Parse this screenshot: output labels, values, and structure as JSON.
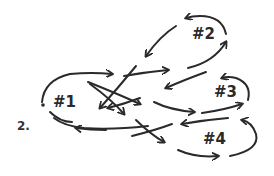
{
  "figure": {
    "label": "2.",
    "style": "hand-drawn",
    "stroke_color": "#2a2a2a",
    "background": "#ffffff"
  },
  "nodes": [
    {
      "id": "n1",
      "label": "#1"
    },
    {
      "id": "n2",
      "label": "#2"
    },
    {
      "id": "n3",
      "label": "#3"
    },
    {
      "id": "n4",
      "label": "#4"
    }
  ],
  "edges": [
    {
      "from": "#1",
      "to": "#3",
      "shape": "curved, over top"
    },
    {
      "from": "#1",
      "to": "#3",
      "shape": "crossing diagonal"
    },
    {
      "from": "#1",
      "to": "#4",
      "shape": "crossing diagonal"
    },
    {
      "from": "#3",
      "to": "#1",
      "shape": "crossing diagonal"
    },
    {
      "from": "#2",
      "to": "#1",
      "shape": "crossing diagonal"
    },
    {
      "from": "#4",
      "to": "#1",
      "shape": "curved, bottom"
    },
    {
      "from": "#1",
      "to": "#2",
      "shape": "curved"
    },
    {
      "from": "#2",
      "to": "#2",
      "shape": "self-loop arc"
    },
    {
      "from": "#2",
      "to": "#1",
      "shape": "curved, top"
    },
    {
      "from": "#3",
      "to": "#3",
      "shape": "self-loop arc"
    },
    {
      "from": "#4",
      "to": "#4",
      "shape": "self-loop arc"
    },
    {
      "from": "#3",
      "to": "#4",
      "shape": "curved"
    },
    {
      "from": "#4",
      "to": "#3",
      "shape": "curved"
    }
  ]
}
